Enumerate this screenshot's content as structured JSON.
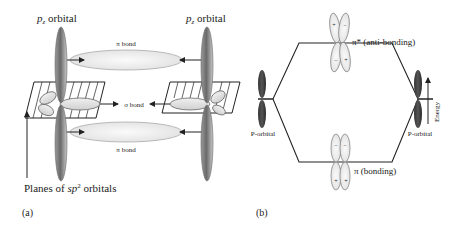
{
  "panel_a": {
    "caption": "(a)",
    "pz_left_label_base": "p",
    "pz_left_label_sub": "z",
    "pz_left_label_rest": " orbital",
    "pz_right_label_base": "p",
    "pz_right_label_sub": "z",
    "pz_right_label_rest": " orbital",
    "pi_bond_top": "π bond",
    "pi_bond_bottom": "π bond",
    "sigma_bond": "σ bond",
    "planes_label_pre": "Planes of ",
    "planes_label_sp": "sp",
    "planes_label_sup": "2",
    "planes_label_post": " orbitals"
  },
  "panel_b": {
    "caption": "(b)",
    "antibonding_label": "π* (anti-bonding)",
    "bonding_label": "π (bonding)",
    "p_orbital_left": "P-orbital",
    "p_orbital_right": "P-orbital",
    "energy_axis": "Energy",
    "antibonding_signs": [
      "+",
      "−",
      "−",
      "+"
    ],
    "bonding_signs": [
      "−",
      "−",
      "+",
      "+"
    ]
  },
  "colors": {
    "lobe_dark": "#555555",
    "lobe_light": "#e8e8e8",
    "line": "#222222"
  }
}
